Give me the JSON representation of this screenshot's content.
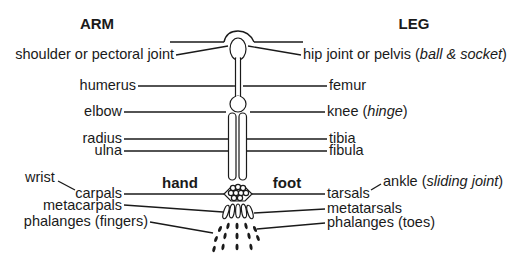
{
  "diagram": {
    "headers": {
      "arm": "ARM",
      "leg": "LEG",
      "hand": "hand",
      "foot": "foot"
    },
    "arm_labels": {
      "shoulder": "shoulder or pectoral joint",
      "humerus": "humerus",
      "elbow": "elbow",
      "radius": "radius",
      "ulna": "ulna",
      "wrist": "wrist",
      "carpals": "carpals",
      "metacarpals": "metacarpals",
      "phalanges": "phalanges (fingers)"
    },
    "leg_labels": {
      "hip_prefix": "hip joint or pelvis (",
      "hip_italic": "ball & socket",
      "hip_suffix": ")",
      "femur": "femur",
      "knee_prefix": "knee (",
      "knee_italic": "hinge",
      "knee_suffix": ")",
      "tibia": "tibia",
      "fibula": "fibula",
      "ankle_prefix": "ankle (",
      "ankle_italic": "sliding joint",
      "ankle_suffix": ")",
      "tarsals": "tarsals",
      "metatarsals": "metatarsals",
      "phalanges": "phalanges (toes)"
    },
    "colors": {
      "ink": "#1a1a1a",
      "background": "#ffffff"
    }
  }
}
